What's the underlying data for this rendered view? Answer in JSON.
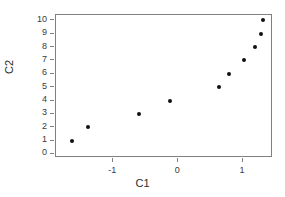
{
  "chart_data": {
    "type": "scatter",
    "title": "",
    "xlabel": "C1",
    "ylabel": "C2",
    "xlim": [
      -1.88,
      1.46
    ],
    "ylim": [
      -0.3,
      10.4
    ],
    "grid": false,
    "legend": null,
    "x_ticks": [
      -1,
      0,
      1
    ],
    "x_tick_labels": [
      "-1",
      "0",
      "1"
    ],
    "y_ticks": [
      0,
      1,
      2,
      3,
      4,
      5,
      6,
      7,
      8,
      9,
      10
    ],
    "y_tick_labels": [
      "0",
      "1",
      "2",
      "3",
      "4",
      "5",
      "6",
      "7",
      "8",
      "9",
      "10"
    ],
    "x": [
      -1.63,
      -1.39,
      -0.6,
      -0.13,
      0.63,
      0.78,
      1.01,
      1.19,
      1.27,
      1.31
    ],
    "y": [
      1,
      2,
      3,
      4,
      5,
      6,
      7,
      8,
      9,
      10
    ],
    "marker": "filled-circle",
    "marker_color": "#111111",
    "frame_color": "#808080",
    "background": "#ffffff"
  }
}
